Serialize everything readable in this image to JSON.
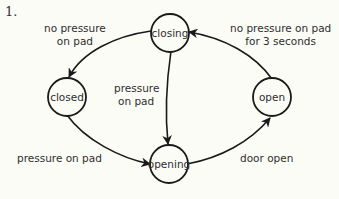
{
  "figure": {
    "number": "1.",
    "type": "state-diagram",
    "stroke_color": "#1a1a1a",
    "background_color": "#fcfcf7"
  },
  "states": [
    {
      "id": "closing",
      "label": "closing"
    },
    {
      "id": "closed",
      "label": "closed"
    },
    {
      "id": "opening",
      "label": "opening"
    },
    {
      "id": "open",
      "label": "open"
    }
  ],
  "transitions": [
    {
      "from": "closing",
      "to": "closed",
      "label_line1": "no pressure",
      "label_line2": "on pad"
    },
    {
      "from": "closing",
      "to": "opening",
      "label_line1": "pressure",
      "label_line2": "on pad"
    },
    {
      "from": "closed",
      "to": "opening",
      "label_line1": "pressure on pad"
    },
    {
      "from": "opening",
      "to": "open",
      "label_line1": "door open"
    },
    {
      "from": "open",
      "to": "closing",
      "label_line1": "no pressure on pad",
      "label_line2": "for 3 seconds"
    }
  ]
}
